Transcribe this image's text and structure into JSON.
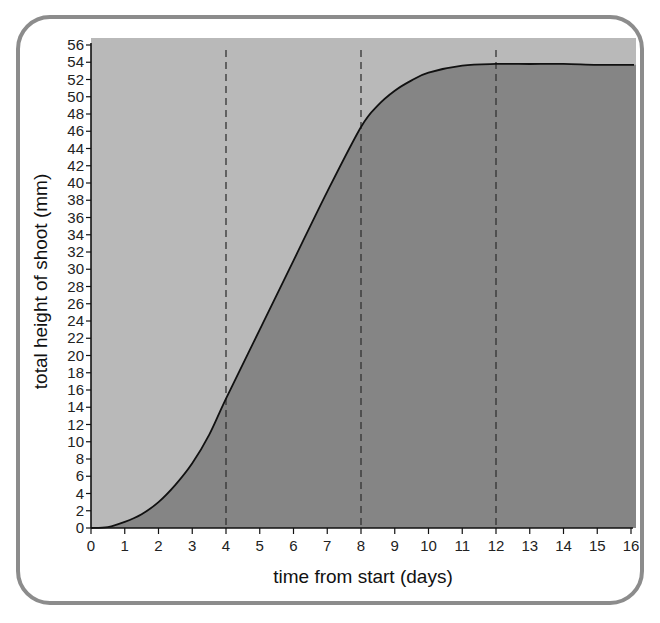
{
  "chart_data": {
    "type": "area",
    "title": "",
    "xlabel": "time from start (days)",
    "ylabel": "total height of shoot (mm)",
    "xlim": [
      0,
      16
    ],
    "ylim": [
      0,
      56
    ],
    "x_ticks": [
      0,
      1,
      2,
      3,
      4,
      5,
      6,
      7,
      8,
      9,
      10,
      11,
      12,
      13,
      14,
      15,
      16
    ],
    "y_ticks": [
      0,
      2,
      4,
      6,
      8,
      10,
      12,
      14,
      16,
      18,
      20,
      22,
      24,
      26,
      28,
      30,
      32,
      34,
      36,
      38,
      40,
      42,
      44,
      46,
      48,
      50,
      52,
      54,
      56
    ],
    "grid": false,
    "legend": null,
    "reference_lines": [
      {
        "axis": "x",
        "value": 4,
        "style": "dashed"
      },
      {
        "axis": "x",
        "value": 8,
        "style": "dashed"
      },
      {
        "axis": "x",
        "value": 12,
        "style": "dashed"
      }
    ],
    "series": [
      {
        "name": "total height of shoot",
        "x": [
          0,
          0.5,
          1,
          1.5,
          2,
          2.5,
          3,
          3.5,
          4,
          5,
          6,
          7,
          8,
          8.5,
          9,
          9.5,
          10,
          11,
          12,
          13,
          14,
          15,
          16
        ],
        "values": [
          0,
          0.1,
          0.7,
          1.6,
          3,
          5,
          7.5,
          10.8,
          15,
          23,
          31,
          39,
          46.5,
          49,
          50.7,
          51.9,
          52.8,
          53.6,
          53.8,
          53.8,
          53.8,
          53.7,
          53.7
        ]
      }
    ],
    "colors": {
      "plot_background": "#b9b9b9",
      "area_fill": "#858585",
      "curve": "#111111",
      "frame_border": "#8c8c8c"
    }
  }
}
